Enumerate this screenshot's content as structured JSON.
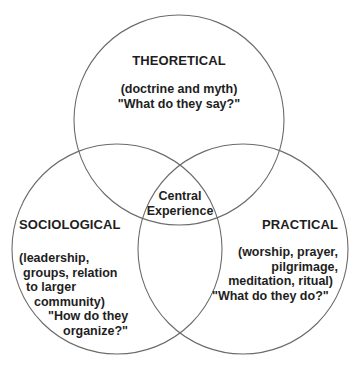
{
  "diagram": {
    "type": "venn",
    "stroke_color": "#6b6b6b",
    "background": "#ffffff",
    "text_color": "#1e1e1e",
    "circles": [
      {
        "id": "theoretical",
        "cx": 179,
        "cy": 120,
        "r": 105
      },
      {
        "id": "sociological",
        "cx": 117,
        "cy": 249,
        "r": 105
      },
      {
        "id": "practical",
        "cx": 243,
        "cy": 249,
        "r": 105
      }
    ],
    "theoretical": {
      "title": "THEORETICAL",
      "lines": [
        "(doctrine and myth)",
        "\"What do they say?\""
      ]
    },
    "sociological": {
      "title": "SOCIOLOGICAL",
      "lines": [
        "(leadership,",
        "groups, relation",
        "to larger",
        "community)",
        "\"How do they",
        "organize?\""
      ]
    },
    "practical": {
      "title": "PRACTICAL",
      "lines": [
        "(worship, prayer,",
        "pilgrimage,",
        "meditation, ritual)",
        "\"What do they do?\""
      ]
    },
    "center": {
      "lines": [
        "Central",
        "Experience"
      ]
    }
  }
}
